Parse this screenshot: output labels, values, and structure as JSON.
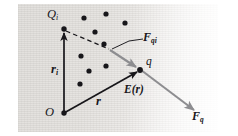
{
  "figure": {
    "kind": "physics-vector-diagram",
    "background_color": "#e6e4e1",
    "ink_color": "#17161a",
    "gray_vector_color": "#8d8d90",
    "width": 238,
    "height": 136
  },
  "labels": {
    "source_charge": "Q",
    "source_charge_sub": "i",
    "source_vector": "r",
    "source_vector_sub": "i",
    "position_vector": "r",
    "test_charge": "q",
    "field": "E(r)",
    "force_on_q_from_Qi": "F",
    "force_on_q_from_Qi_sub": "qi",
    "total_force": "F",
    "total_force_sub": "q",
    "origin": "O"
  },
  "points": {
    "origin": {
      "x": 64,
      "y": 113,
      "name": "origin-O"
    },
    "source_charge_Qi": {
      "x": 64,
      "y": 29,
      "name": "charge-Qi"
    },
    "test_charge_q": {
      "x": 140,
      "y": 70,
      "name": "charge-q"
    },
    "force_qi_tail": {
      "x": 110,
      "y": 50,
      "name": "Fqi-tail"
    },
    "force_q_head": {
      "x": 196,
      "y": 112,
      "name": "Fq-head"
    }
  },
  "vectors": [
    {
      "name": "vector-r-i",
      "label": "r_i",
      "from": "origin",
      "to": "source_charge_Qi",
      "style": "solid-black"
    },
    {
      "name": "vector-r",
      "label": "r",
      "from": "origin",
      "to": "test_charge_q",
      "style": "solid-black"
    },
    {
      "name": "vector-F-qi",
      "label": "F_qi",
      "from": "force_qi_tail",
      "to": "test_charge_q",
      "style": "solid-gray"
    },
    {
      "name": "vector-F-q",
      "label": "F_q",
      "from": "test_charge_q",
      "to": "force_q_head",
      "style": "solid-gray"
    },
    {
      "name": "dashed-separation-line",
      "label": "",
      "from": "source_charge_Qi",
      "to": "force_qi_tail",
      "style": "dashed-black"
    }
  ],
  "leader_line": {
    "name": "Fqi-leader",
    "from_x": 110,
    "from_y": 50,
    "to_x": 141,
    "to_y": 38
  },
  "charge_dots": [
    {
      "x": 84,
      "y": 18
    },
    {
      "x": 106,
      "y": 14
    },
    {
      "x": 125,
      "y": 23
    },
    {
      "x": 95,
      "y": 32
    },
    {
      "x": 104,
      "y": 44
    },
    {
      "x": 81,
      "y": 56
    },
    {
      "x": 106,
      "y": 66
    },
    {
      "x": 89,
      "y": 71
    },
    {
      "x": 80,
      "y": 84
    }
  ],
  "dot_radius": 2.6
}
